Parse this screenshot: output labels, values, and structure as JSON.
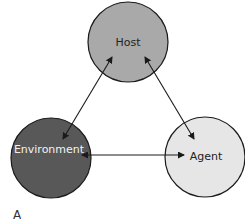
{
  "diagram": {
    "panel_label": "A",
    "nodes": [
      {
        "id": "host",
        "label": "Host",
        "fill": "#a9a9a9",
        "text_color": "#222222"
      },
      {
        "id": "environment",
        "label": "Environment",
        "fill": "#585858",
        "text_color": "#f2f2f2"
      },
      {
        "id": "agent",
        "label": "Agent",
        "fill": "#e6e6e6",
        "text_color": "#222222"
      }
    ],
    "edges": [
      {
        "from": "host",
        "to": "environment",
        "direction": "bidirectional"
      },
      {
        "from": "host",
        "to": "agent",
        "direction": "bidirectional"
      },
      {
        "from": "environment",
        "to": "agent",
        "direction": "bidirectional"
      }
    ],
    "stroke_color": "#1a1a1a"
  }
}
